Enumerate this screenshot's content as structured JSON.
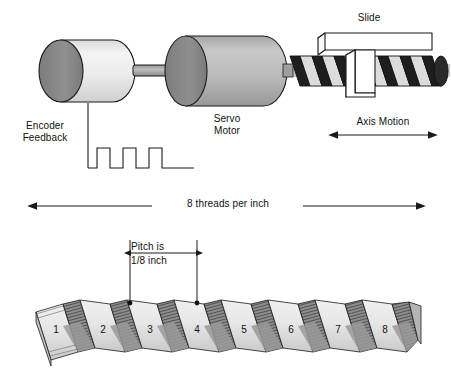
{
  "diagram": {
    "title_labels": {
      "encoder": "Encoder\nFeedback",
      "servo": "Servo\nMotor",
      "slide": "Slide",
      "axis_motion": "Axis Motion"
    },
    "dimension_labels": {
      "threads_per_inch": "8 threads per inch",
      "pitch_line1": "Pitch is",
      "pitch_line2": "1/8 inch"
    },
    "thread_numbers": [
      "1",
      "2",
      "3",
      "4",
      "5",
      "6",
      "7",
      "8"
    ],
    "colors": {
      "encoder_body": "#ebebeb",
      "encoder_cap": "#8a8a8a",
      "motor_body": "#b8b8b8",
      "motor_cap": "#8a8a8a",
      "shaft": "#a8a8a8",
      "screw_light": "#d8d8d8",
      "screw_dark": "#1e1e1e",
      "slide_fill": "#ffffff",
      "outline": "#1a1a1a",
      "thread_face": "#e4e4e4",
      "thread_flank": "#4a4a4a",
      "thread_mid": "#9a9a9a"
    },
    "icons": {
      "encoder_waveform": "square-wave-icon",
      "axis_arrow": "double-arrow-icon",
      "dimension_arrow": "double-arrow-icon"
    }
  }
}
